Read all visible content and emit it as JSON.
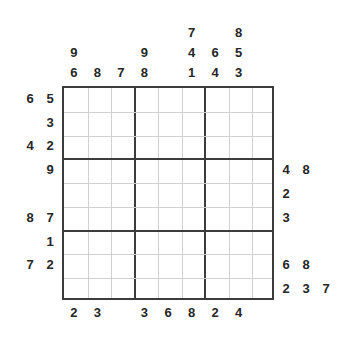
{
  "puzzle": {
    "type": "sudoku-frame-puzzle",
    "grid": {
      "rows": 9,
      "columns": 9,
      "block_rows": 3,
      "block_columns": 3,
      "cells_empty": true
    },
    "colors": {
      "text": "#262626",
      "thick_line": "#3c3c3c",
      "thin_line": "#d0d0d0",
      "cell_background": "#ffffff",
      "page_background": "#ffffff"
    },
    "clues": {
      "top": [
        {
          "column": 1,
          "values": [
            "9",
            "6"
          ]
        },
        {
          "column": 2,
          "values": [
            "8"
          ]
        },
        {
          "column": 3,
          "values": [
            "7"
          ]
        },
        {
          "column": 4,
          "values": [
            "9",
            "8"
          ]
        },
        {
          "column": 5,
          "values": []
        },
        {
          "column": 6,
          "values": [
            "7",
            "4",
            "1"
          ]
        },
        {
          "column": 7,
          "values": [
            "6",
            "4"
          ]
        },
        {
          "column": 8,
          "values": [
            "8",
            "5",
            "3"
          ]
        },
        {
          "column": 9,
          "values": []
        }
      ],
      "left": [
        {
          "row": 1,
          "values": [
            "6",
            "5"
          ]
        },
        {
          "row": 2,
          "values": [
            "3"
          ]
        },
        {
          "row": 3,
          "values": [
            "4",
            "2"
          ]
        },
        {
          "row": 4,
          "values": [
            "9"
          ]
        },
        {
          "row": 5,
          "values": []
        },
        {
          "row": 6,
          "values": [
            "8",
            "7"
          ]
        },
        {
          "row": 7,
          "values": [
            "1"
          ]
        },
        {
          "row": 8,
          "values": [
            "7",
            "2"
          ]
        },
        {
          "row": 9,
          "values": []
        }
      ],
      "right": [
        {
          "row": 1,
          "values": []
        },
        {
          "row": 2,
          "values": []
        },
        {
          "row": 3,
          "values": []
        },
        {
          "row": 4,
          "values": [
            "4",
            "8"
          ]
        },
        {
          "row": 5,
          "values": [
            "2"
          ]
        },
        {
          "row": 6,
          "values": [
            "3"
          ]
        },
        {
          "row": 7,
          "values": []
        },
        {
          "row": 8,
          "values": [
            "6",
            "8"
          ]
        },
        {
          "row": 9,
          "values": [
            "2",
            "3",
            "7"
          ]
        }
      ],
      "bottom": [
        {
          "column": 1,
          "values": [
            "2"
          ]
        },
        {
          "column": 2,
          "values": [
            "3"
          ]
        },
        {
          "column": 3,
          "values": []
        },
        {
          "column": 4,
          "values": [
            "3"
          ]
        },
        {
          "column": 5,
          "values": [
            "6"
          ]
        },
        {
          "column": 6,
          "values": [
            "8"
          ]
        },
        {
          "column": 7,
          "values": [
            "2"
          ]
        },
        {
          "column": 8,
          "values": [
            "4"
          ]
        },
        {
          "column": 9,
          "values": []
        }
      ]
    }
  }
}
